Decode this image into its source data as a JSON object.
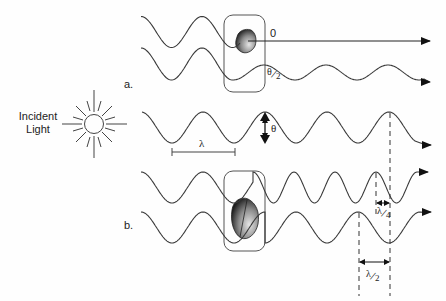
{
  "figure": {
    "incident_label_line1": "Incident",
    "incident_label_line2": "Light",
    "panel_a_label": "a.",
    "panel_b_label": "b.",
    "zero_phase_label": "0",
    "theta_label": "θ",
    "theta_half": {
      "num": "θ",
      "den": "2"
    },
    "lambda_label": "λ",
    "lambda_quarter": {
      "num": "λ",
      "den": "4"
    },
    "lambda_half": {
      "num": "λ",
      "den": "2"
    }
  },
  "colors": {
    "stroke": "#3a3a3a",
    "particle_dark": "#2a2a2a",
    "particle_light": "#d8d8d8"
  },
  "waves": [
    {
      "id": "a-upper",
      "segments": [
        {
          "x0": 141,
          "x1": 240,
          "center": 32,
          "amp": 15.5,
          "period": 61,
          "phase_x": 141,
          "start": "peak"
        }
      ],
      "straight": {
        "x0": 248,
        "x1": 430,
        "y": 41
      }
    },
    {
      "id": "a-lower",
      "segments": [
        {
          "x0": 141,
          "x1": 233,
          "center": 64,
          "amp": 16,
          "period": 61,
          "phase_x": 141,
          "start": "peak"
        },
        {
          "x0": 233,
          "x1": 424,
          "center": 72.5,
          "amp": 7.5,
          "period": 62,
          "phase_x": 233,
          "start": "trough"
        }
      ],
      "arrow": {
        "x": 430,
        "y": 82
      }
    },
    {
      "id": "reference",
      "segments": [
        {
          "x0": 142,
          "x1": 415,
          "center": 127.5,
          "amp": 15.5,
          "period": 62,
          "phase_x": 141,
          "start": "peak"
        }
      ],
      "arrow": {
        "x": 431,
        "y": 145
      }
    },
    {
      "id": "b-upper",
      "segments": [
        {
          "x0": 141,
          "x1": 253,
          "center": 187.5,
          "amp": 15.5,
          "period": 62,
          "phase_x": 141,
          "start": "peak"
        },
        {
          "x0": 253,
          "x1": 417,
          "center": 187.5,
          "amp": 15.5,
          "period": 41,
          "phase_x": 253,
          "start": "peak"
        }
      ],
      "arrow": {
        "x": 428,
        "y": 172
      }
    },
    {
      "id": "b-lower",
      "segments": [
        {
          "x0": 141,
          "x1": 265,
          "center": 227.5,
          "amp": 15.5,
          "period": 62,
          "phase_x": 141,
          "start": "peak"
        },
        {
          "x0": 265,
          "x1": 422,
          "center": 227.5,
          "amp": 15.5,
          "period": 62,
          "phase_x": 265,
          "start": "trough"
        }
      ],
      "arrow": {
        "x": 431,
        "y": 212
      }
    }
  ]
}
